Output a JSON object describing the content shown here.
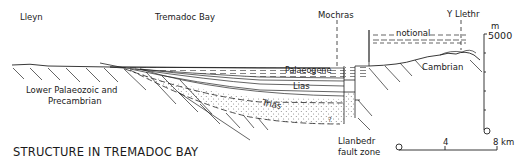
{
  "title": "STRUCTURE IN TREMADOC BAY",
  "locations": {
    "lleyn": "Lleyn",
    "tremadoc_bay": "Tremadoc Bay",
    "mochras": "Mochras",
    "y_llethr": "Y Llethr"
  },
  "units": {
    "notional": "notional",
    "palaeogene": "Palaeogene",
    "lias": "Lias",
    "trias": "Trias",
    "cambrian": "Cambrian",
    "basement_line1": "Lower Palaeozoic and",
    "basement_line2": "Precambrian",
    "uncertain_marker": "?"
  },
  "fault": {
    "line1": "Llanbedr",
    "line2": "fault zone"
  },
  "vertical_scale": {
    "unit": "m",
    "top": "5000",
    "bottom": "0"
  },
  "horizontal_scale": {
    "start": "0",
    "mid": "4",
    "end": "8 km"
  }
}
